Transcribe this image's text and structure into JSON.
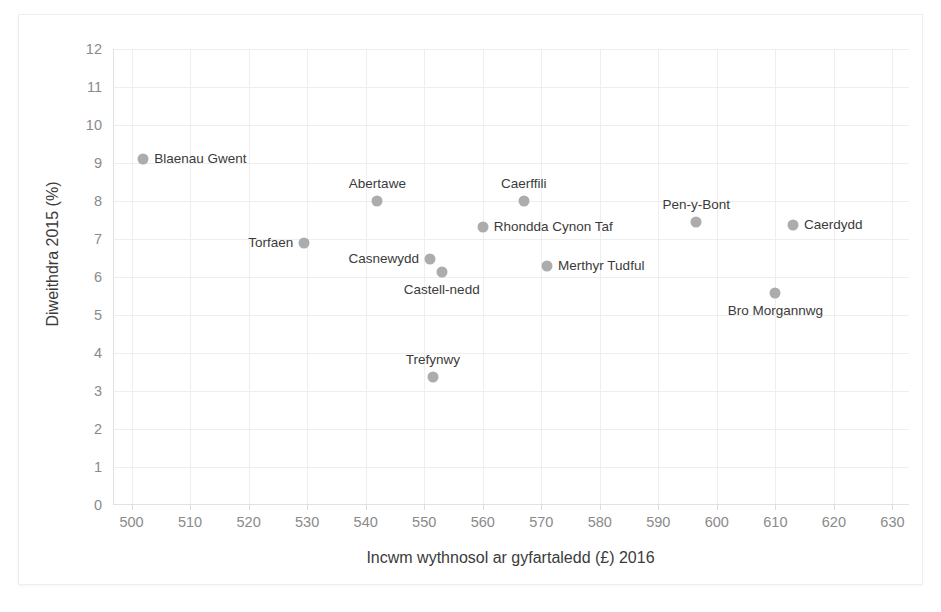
{
  "chart_data": {
    "type": "scatter",
    "title": "",
    "xlabel": "Incwm wythnosol ar gyfartaledd (£) 2016",
    "ylabel": "Diweithdra 2015 (%)",
    "xlim": [
      497,
      633
    ],
    "ylim": [
      0,
      12
    ],
    "xticks": [
      500,
      510,
      520,
      530,
      540,
      550,
      560,
      570,
      580,
      590,
      600,
      610,
      620,
      630
    ],
    "yticks": [
      0,
      1,
      2,
      3,
      4,
      5,
      6,
      7,
      8,
      9,
      10,
      11,
      12
    ],
    "grid": true,
    "legend": "none",
    "marker_color": "#acacac",
    "gridline_color": "#eeeeee",
    "axis_color": "#e2e2e2",
    "label_color": "#3b3b3b",
    "tick_color": "#8a8a8a",
    "points": [
      {
        "label": "Blaenau Gwent",
        "x": 502.0,
        "y": 9.1,
        "label_pos": "right"
      },
      {
        "label": "Torfaen",
        "x": 529.5,
        "y": 6.9,
        "label_pos": "left"
      },
      {
        "label": "Abertawe",
        "x": 542.0,
        "y": 8.0,
        "label_pos": "above"
      },
      {
        "label": "Casnewydd",
        "x": 551.0,
        "y": 6.48,
        "label_pos": "left"
      },
      {
        "label": "Trefynwy",
        "x": 551.5,
        "y": 3.37,
        "label_pos": "above"
      },
      {
        "label": "Castell-nedd",
        "x": 553.0,
        "y": 6.12,
        "label_pos": "below"
      },
      {
        "label": "Rhondda Cynon Taf",
        "x": 560.0,
        "y": 7.32,
        "label_pos": "right"
      },
      {
        "label": "Caerffili",
        "x": 567.0,
        "y": 8.0,
        "label_pos": "above"
      },
      {
        "label": "Merthyr Tudful",
        "x": 571.0,
        "y": 6.3,
        "label_pos": "right"
      },
      {
        "label": "Pen-y-Bont",
        "x": 596.5,
        "y": 7.45,
        "label_pos": "above"
      },
      {
        "label": "Bro Morgannwg",
        "x": 610.0,
        "y": 5.58,
        "label_pos": "below"
      },
      {
        "label": "Caerdydd",
        "x": 613.0,
        "y": 7.37,
        "label_pos": "right"
      }
    ]
  }
}
